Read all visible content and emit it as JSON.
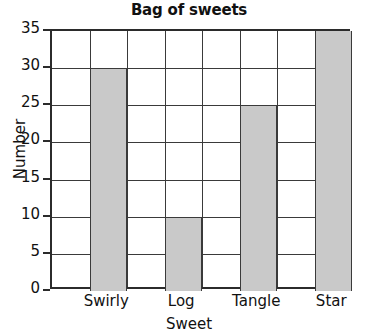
{
  "chart_data": {
    "type": "bar",
    "title": "Bag of sweets",
    "xlabel": "Sweet",
    "ylabel": "Number",
    "categories": [
      "Swirly",
      "Log",
      "Tangle",
      "Star"
    ],
    "values": [
      30,
      10,
      25,
      35
    ],
    "ylim": [
      0,
      35
    ],
    "ytick_step": 5,
    "yticks": [
      0,
      5,
      10,
      15,
      20,
      25,
      30,
      35
    ],
    "ytick_labels": [
      "0",
      "5",
      "10",
      "15",
      "20",
      "25",
      "30",
      "35"
    ],
    "grid": true,
    "legend": false,
    "bar_color": "#c9c9c9",
    "bar_edge_color": "#3a3a3a",
    "axis_color": "#2b2b2b",
    "background": "#ffffff"
  }
}
